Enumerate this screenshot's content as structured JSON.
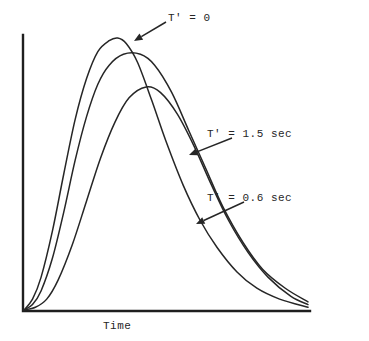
{
  "chart_data": {
    "type": "line",
    "title": "",
    "xlabel": "Time",
    "ylabel": "",
    "grid": false,
    "legend_position": "inline-annotations",
    "axis_style": "arrowless-L-frame",
    "xlim": [
      0,
      100
    ],
    "ylim": [
      0,
      100
    ],
    "x_tick_labels": [],
    "y_tick_labels": [],
    "annotations": [
      {
        "id": "annot-0",
        "text": "T' = 0",
        "label_x": 168,
        "label_y": 12,
        "arrow_from_x": 166,
        "arrow_from_y": 22,
        "arrow_to_x": 134,
        "arrow_to_y": 41,
        "series": "T' = 0"
      },
      {
        "id": "annot-15",
        "text": "T' = 1.5 sec",
        "label_x": 207,
        "label_y": 128,
        "arrow_from_x": 232,
        "arrow_from_y": 138,
        "arrow_to_x": 189,
        "arrow_to_y": 155,
        "series": "T' = 1.5 sec"
      },
      {
        "id": "annot-06",
        "text": "T' = 0.6 sec",
        "label_x": 207,
        "label_y": 192,
        "arrow_from_x": 244,
        "arrow_from_y": 202,
        "arrow_to_x": 196,
        "arrow_to_y": 224,
        "series": "T' = 0.6 sec"
      }
    ],
    "series": [
      {
        "name": "T' = 0",
        "peak_x": 33,
        "peak_y": 100,
        "x": [
          0,
          3,
          6,
          10,
          14,
          18,
          22,
          26,
          30,
          33,
          36,
          40,
          45,
          50,
          56,
          62,
          68,
          75,
          82,
          90,
          100
        ],
        "values": [
          0,
          4,
          12,
          29,
          50,
          70,
          85,
          95,
          99,
          100,
          98,
          91,
          77,
          62,
          46,
          33,
          23,
          14,
          8,
          4,
          1
        ]
      },
      {
        "name": "T' = 1.5 sec",
        "peak_x": 41,
        "peak_y": 94,
        "x": [
          0,
          3,
          6,
          10,
          14,
          18,
          22,
          26,
          30,
          35,
          41,
          46,
          52,
          58,
          64,
          70,
          77,
          84,
          92,
          100
        ],
        "values": [
          0,
          2,
          7,
          19,
          36,
          55,
          71,
          83,
          90,
          94,
          94,
          90,
          80,
          66,
          52,
          38,
          25,
          15,
          8,
          3
        ]
      },
      {
        "name": "T' = 0.6 sec",
        "peak_x": 43,
        "peak_y": 82,
        "x": [
          0,
          4,
          8,
          12,
          17,
          22,
          27,
          32,
          37,
          43,
          48,
          54,
          60,
          66,
          72,
          79,
          86,
          94,
          100
        ],
        "values": [
          0,
          1,
          4,
          11,
          24,
          40,
          56,
          69,
          78,
          82,
          80,
          72,
          60,
          46,
          33,
          21,
          12,
          5,
          2
        ]
      }
    ],
    "axes": {
      "origin_x": 23,
      "origin_y": 311,
      "y_top": 35,
      "x_right": 310,
      "line_color": "#1f1f1f",
      "line_width": 2.4
    },
    "curve_color": "#262626",
    "curve_width": 1.5
  }
}
